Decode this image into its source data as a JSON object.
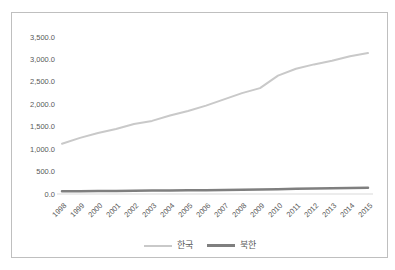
{
  "window": {
    "background_color": "#ffffff",
    "frame_border_color": "#bfbfbf"
  },
  "chart_data": {
    "type": "line",
    "title": "",
    "xlabel": "",
    "ylabel": "",
    "categories": [
      "1998",
      "1999",
      "2000",
      "2001",
      "2002",
      "2003",
      "2004",
      "2005",
      "2006",
      "2007",
      "2008",
      "2009",
      "2010",
      "2011",
      "2012",
      "2013",
      "2014",
      "2015"
    ],
    "series": [
      {
        "name": "한국",
        "color": "#c9c9c9",
        "stroke_width": 2,
        "values": [
          1120,
          1250,
          1360,
          1450,
          1560,
          1630,
          1750,
          1850,
          1970,
          2110,
          2250,
          2360,
          2640,
          2790,
          2890,
          2970,
          3070,
          3140
        ]
      },
      {
        "name": "북한",
        "color": "#7f7f7f",
        "stroke_width": 2.5,
        "values": [
          60,
          62,
          65,
          68,
          72,
          75,
          78,
          82,
          85,
          90,
          95,
          100,
          108,
          115,
          120,
          126,
          133,
          140
        ]
      }
    ],
    "ylim": [
      0,
      3500
    ],
    "y_tick_step": 500,
    "y_tick_labels": [
      "0.0",
      "500.0",
      "1,000.0",
      "1,500.0",
      "2,000.0",
      "2,500.0",
      "3,000.0",
      "3,500.0"
    ],
    "grid": false,
    "legend_position": "bottom",
    "axis_text_color": "#595959",
    "axis_line_color": "#d9d9d9",
    "x_label_rotation_deg": -45
  }
}
